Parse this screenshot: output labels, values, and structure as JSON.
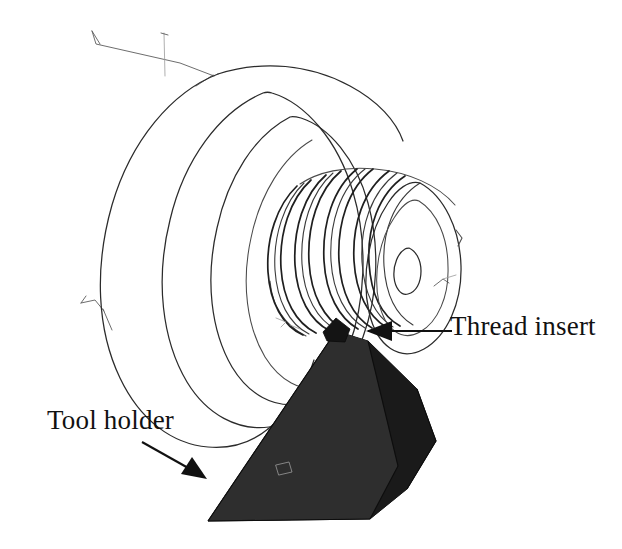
{
  "figure": {
    "kind": "technical-line-illustration",
    "background_color": "#ffffff",
    "ink_color": "#111111",
    "holder_fill_color": "#242424",
    "width": 622,
    "height": 549
  },
  "labels": {
    "thread_insert": "Thread insert",
    "tool_holder": "Tool holder"
  },
  "callouts": [
    {
      "id": "thread-insert-callout",
      "label": "Thread insert",
      "direction": "points-left",
      "from_x": 452,
      "from_y": 331,
      "to_x": 343,
      "to_y": 331
    },
    {
      "id": "tool-holder-callout",
      "label": "Tool holder",
      "direction": "points-down-right",
      "from_x": 143,
      "from_y": 443,
      "to_x": 206,
      "to_y": 478
    }
  ],
  "parts": {
    "chuck_disc": {
      "name": "chuck-disc",
      "description": "Large cylindrical chuck body seen in perspective"
    },
    "step_ring": {
      "name": "step-ring",
      "description": "Intermediate stepped shoulder of the workpiece"
    },
    "threaded_section": {
      "name": "threaded-section",
      "description": "Cylindrical section with cut external thread",
      "thread_turns": 9
    },
    "end_face": {
      "name": "workpiece-end-face",
      "description": "Front face of workpiece with center bore"
    },
    "center_bore": {
      "name": "center-bore",
      "description": "Small center hole on the workpiece end face"
    },
    "tool_holder": {
      "name": "tool-holder",
      "description": "Dark wedge-shaped tool holder block"
    },
    "thread_insert": {
      "name": "thread-insert",
      "description": "Small cutting insert at the tip of the tool holder"
    }
  },
  "leader_marks": [
    {
      "name": "top-left-tick-a",
      "x": 95,
      "y": 32
    },
    {
      "name": "top-left-tick-b",
      "x": 163,
      "y": 33
    },
    {
      "name": "left-edge-tick",
      "x": 86,
      "y": 301
    }
  ]
}
